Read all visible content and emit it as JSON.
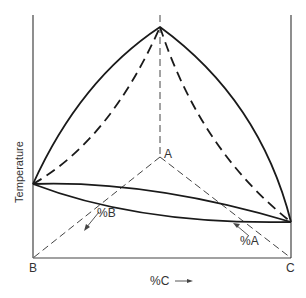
{
  "diagram": {
    "type": "ternary-phase-diagram-prism",
    "axis_label_vertical": "Temperature",
    "vertex_labels": {
      "A": "A",
      "B": "B",
      "C": "C"
    },
    "composition_labels": {
      "percent_A": "%A",
      "percent_B": "%B",
      "percent_C": "%C →"
    },
    "colors": {
      "line": "#1a1a1a",
      "axis": "#555555",
      "background": "#ffffff"
    }
  }
}
